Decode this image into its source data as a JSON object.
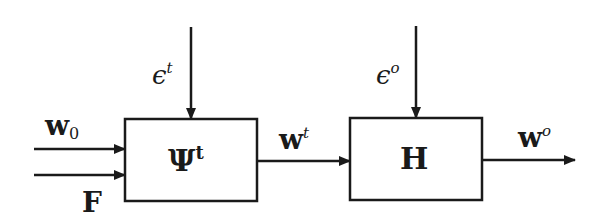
{
  "diagram": {
    "type": "block-diagram",
    "blocks": [
      {
        "id": "psi",
        "label": "Ψ",
        "superscript": "t"
      },
      {
        "id": "h",
        "label": "H",
        "superscript": ""
      }
    ],
    "inputs": [
      {
        "id": "w0",
        "label": "w",
        "subscript": "0",
        "target": "psi"
      },
      {
        "id": "F",
        "label": "F",
        "target": "psi"
      },
      {
        "id": "eps_t",
        "label": "ϵ",
        "superscript": "t",
        "target": "psi"
      },
      {
        "id": "eps_o",
        "label": "ϵ",
        "superscript": "o",
        "target": "h"
      }
    ],
    "signals": [
      {
        "id": "wt",
        "label": "w",
        "superscript": "t",
        "from": "psi",
        "to": "h"
      },
      {
        "id": "wo",
        "label": "w",
        "superscript": "o",
        "from": "h",
        "to": "output"
      }
    ]
  }
}
